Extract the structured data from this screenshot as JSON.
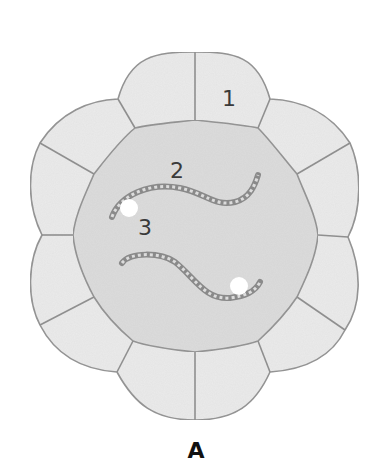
{
  "figure": {
    "caption": "A",
    "labels": [
      {
        "id": "1",
        "text": "1",
        "x": 229,
        "y": 99,
        "refers_to": "outer cell"
      },
      {
        "id": "2",
        "text": "2",
        "x": 177,
        "y": 171,
        "refers_to": "chromosome strand"
      },
      {
        "id": "3",
        "text": "3",
        "x": 145,
        "y": 228,
        "refers_to": "white bead / centromere"
      }
    ],
    "colors": {
      "outer_cell_fill": "#ebebeb",
      "inner_circle_fill": "#dcdcdc",
      "stroke": "#8f8f8f",
      "chromosome": "#8a8a8a",
      "bead": "#ffffff",
      "label_text": "#3a3a3a"
    }
  }
}
